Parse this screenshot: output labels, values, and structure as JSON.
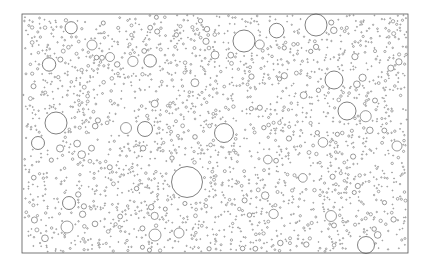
{
  "figure": {
    "title": "",
    "caption": "",
    "canvas": {
      "width": 430,
      "height": 269
    },
    "background_color": "#ffffff"
  },
  "frame": {
    "label": "plot-frame",
    "x": 22,
    "y": 14,
    "width": 386,
    "height": 239,
    "stroke_color": "#555555",
    "stroke_width": 0.8,
    "fill": "none"
  },
  "chart_data": {
    "type": "scatter",
    "title": "",
    "subtitle": "",
    "xlabel": "",
    "ylabel": "",
    "xlim": [
      22,
      408
    ],
    "ylim": [
      14,
      253
    ],
    "grid": false,
    "legend": null,
    "annotations": [],
    "tick_labels": {
      "x": [],
      "y": []
    },
    "marker": "open-circle",
    "stroke_color": "#4a4a4a",
    "fill_color": "none",
    "size_distribution": {
      "radius_min": 0.45,
      "radius_max": 16.0,
      "exponent": -2.6,
      "count_total": 2100
    },
    "named_large_disks": [
      {
        "name": "disk-center-large",
        "cx": 187,
        "cy": 182,
        "r": 15.5
      },
      {
        "name": "disk-top-right-a",
        "cx": 316,
        "cy": 25,
        "r": 11.0
      },
      {
        "name": "disk-top-center",
        "cx": 244,
        "cy": 41,
        "r": 11.0
      },
      {
        "name": "disk-left-mid",
        "cx": 56,
        "cy": 123,
        "r": 11.0
      },
      {
        "name": "disk-right-upper",
        "cx": 334,
        "cy": 80,
        "r": 9.0
      },
      {
        "name": "disk-right-mid",
        "cx": 347,
        "cy": 111,
        "r": 9.0
      },
      {
        "name": "disk-center-mid",
        "cx": 224,
        "cy": 133,
        "r": 9.5
      },
      {
        "name": "disk-bottom-right",
        "cx": 366,
        "cy": 245,
        "r": 8.5
      },
      {
        "name": "disk-left-lower",
        "cx": 38,
        "cy": 143,
        "r": 6.5
      },
      {
        "name": "disk-mid-left",
        "cx": 145,
        "cy": 129,
        "r": 7.5
      },
      {
        "name": "disk-mid-left-b",
        "cx": 126,
        "cy": 128,
        "r": 5.5
      },
      {
        "name": "disk-bottom-left-a",
        "cx": 69,
        "cy": 203,
        "r": 6.5
      },
      {
        "name": "disk-bottom-left-b",
        "cx": 67,
        "cy": 227,
        "r": 6.0
      },
      {
        "name": "disk-bottom-center",
        "cx": 155,
        "cy": 235,
        "r": 6.0
      },
      {
        "name": "disk-bottom-mid",
        "cx": 179,
        "cy": 233,
        "r": 5.0
      },
      {
        "name": "disk-right-lower",
        "cx": 331,
        "cy": 216,
        "r": 5.5
      },
      {
        "name": "disk-far-right",
        "cx": 397,
        "cy": 146,
        "r": 5.0
      },
      {
        "name": "disk-upper-left",
        "cx": 92,
        "cy": 45,
        "r": 5.0
      },
      {
        "name": "disk-upper-mid",
        "cx": 110,
        "cy": 57,
        "r": 4.5
      },
      {
        "name": "disk-near-top",
        "cx": 215,
        "cy": 55,
        "r": 4.0
      }
    ]
  }
}
